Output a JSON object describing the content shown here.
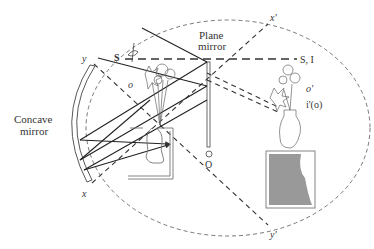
{
  "diagram": {
    "type": "optics-ray-diagram",
    "labels": {
      "plane_mirror_line1": "Plane",
      "plane_mirror_line2": "mirror",
      "concave_mirror_line1": "Concave",
      "concave_mirror_line2": "mirror",
      "x": "x",
      "x_prime": "x'",
      "y": "y",
      "y_prime": "y'",
      "s": "S",
      "s_i": "S, I",
      "o": "o",
      "o_prime": "o'",
      "i_prime_o": "i'(o)",
      "O": "O"
    },
    "colors": {
      "ink": "#333333",
      "dashed": "#444444",
      "stand_fill": "#999999",
      "background": "#ffffff"
    },
    "elements": [
      "dashed ellipse (field boundary)",
      "concave mirror (double arc, left)",
      "plane mirror (vertical double line, center)",
      "solid rays with arrowheads",
      "dashed construction lines x-x' and y-y'",
      "horizontal dashed line S to S, I",
      "eye glyph near S",
      "real flower bouquet (inverted over box)",
      "box with hidden vase (left)",
      "image vase with flowers on grey stand (right)"
    ]
  }
}
